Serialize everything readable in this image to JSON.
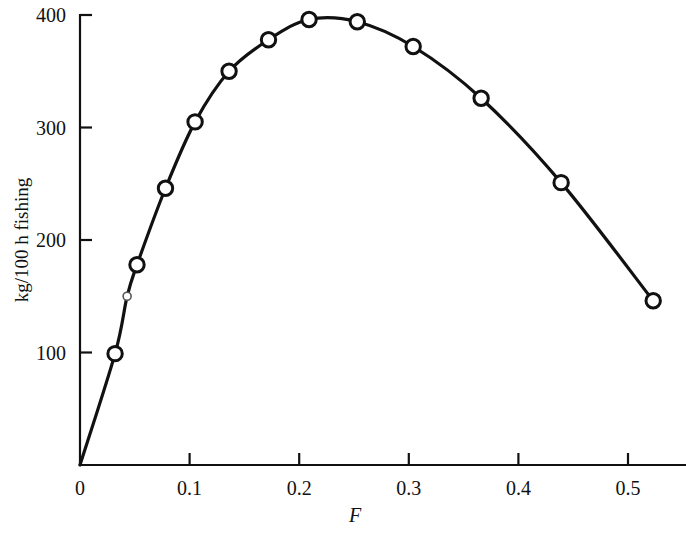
{
  "chart_data": {
    "type": "line",
    "title": "",
    "subtitle": "",
    "xlabel": "F",
    "ylabel": "kg/100 h fishing",
    "xlim": [
      0,
      0.555
    ],
    "ylim": [
      0,
      400
    ],
    "grid": false,
    "legend": null,
    "xticks": [
      0,
      0.1,
      0.2,
      0.3,
      0.4,
      0.5
    ],
    "xtick_labels": [
      "0",
      "0.1",
      "0.2",
      "0.3",
      "0.4",
      "0.5"
    ],
    "yticks": [
      100,
      200,
      300,
      400
    ],
    "ytick_labels": [
      "100",
      "200",
      "300",
      "400"
    ],
    "marker": "open-circle",
    "line_color": "#111111",
    "marker_face_color": "#ffffff",
    "series": [
      {
        "name": "yield",
        "x": [
          0.0,
          0.032,
          0.043,
          0.052,
          0.078,
          0.105,
          0.136,
          0.172,
          0.209,
          0.253,
          0.304,
          0.366,
          0.439,
          0.523
        ],
        "y": [
          0,
          99,
          150,
          178,
          246,
          305,
          350,
          378,
          396,
          394,
          372,
          326,
          251,
          146
        ],
        "show_marker": [
          false,
          true,
          true,
          true,
          true,
          true,
          true,
          true,
          true,
          true,
          true,
          true,
          true,
          true
        ],
        "faint_marker": [
          false,
          false,
          true,
          false,
          false,
          false,
          false,
          false,
          false,
          false,
          false,
          false,
          false,
          false
        ]
      }
    ],
    "annotations": []
  },
  "axis": {
    "x_title": "F",
    "y_title": "kg/100 h fishing"
  }
}
